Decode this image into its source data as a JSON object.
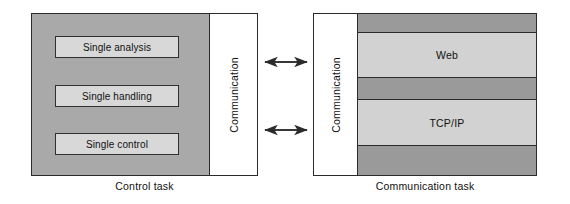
{
  "figure": {
    "type": "block-diagram",
    "background_color": "#ffffff"
  },
  "colors": {
    "panel_gray": "#a9a9a9",
    "module_fill": "#d8d8d8",
    "band_dark": "#9a9a9a",
    "band_light": "#d2d2d2",
    "stroke": "#2b2b2b",
    "white": "#ffffff"
  },
  "control_task": {
    "caption": "Control task",
    "modules": [
      {
        "label": "Single analysis"
      },
      {
        "label": "Single handling"
      },
      {
        "label": "Single control"
      }
    ],
    "communication_column": {
      "label": "Communication",
      "orientation": "vertical-bottom-to-top"
    }
  },
  "communication_task": {
    "caption": "Communication task",
    "communication_column": {
      "label": "Communication",
      "orientation": "vertical-bottom-to-top"
    },
    "stack_bands": [
      {
        "label": "",
        "tone": "dark"
      },
      {
        "label": "Web",
        "tone": "light"
      },
      {
        "label": "",
        "tone": "dark"
      },
      {
        "label": "TCP/IP",
        "tone": "light"
      },
      {
        "label": "",
        "tone": "dark"
      }
    ]
  },
  "connectors": [
    {
      "name": "upper-link",
      "style": "double-headed-arrow"
    },
    {
      "name": "lower-link",
      "style": "double-headed-arrow"
    }
  ]
}
